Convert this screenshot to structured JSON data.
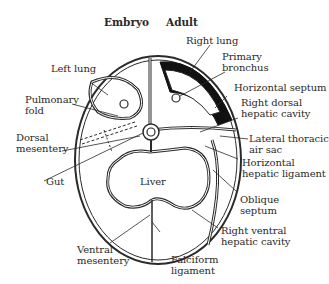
{
  "headers": {
    "embryo": "Embryo",
    "adult": "Adult"
  },
  "labels": {
    "left_lung": "Left lung",
    "pulmonary_fold": "Pulmonary\nfold",
    "dorsal_mesentery": "Dorsal\nmesentery",
    "gut": "Gut",
    "liver": "Liver",
    "ventral_mesentery": "Ventral\nmesentery",
    "falciform_ligament": "Falciform\nligament",
    "right_lung": "Right lung",
    "primary_bronchus": "Primary\nbronchus",
    "horizontal_septum": "Horizontal septum",
    "right_dorsal_hepatic_cavity": "Right dorsal\nhepatic cavity",
    "lateral_thoracic_air_sac": "Lateral thoracic\nair sac",
    "horizontal_hepatic_ligament": "Horizontal\nhepatic ligament",
    "oblique_septum": "Oblique\nseptum",
    "right_ventral_hepatic_cavity": "Right ventral\nhepatic cavity"
  },
  "colors": {
    "line": "#2a2a2a",
    "fill": "#ffffff",
    "septum": "#111111"
  }
}
